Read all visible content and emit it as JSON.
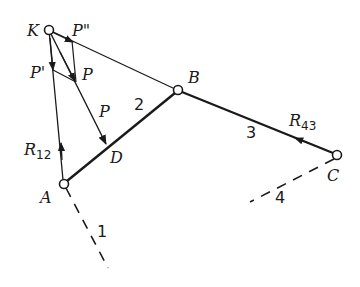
{
  "diagram": {
    "type": "mechanism force diagram",
    "points": {
      "K": {
        "label": "K",
        "x": 49,
        "y": 30
      },
      "B": {
        "label": "B",
        "x": 178,
        "y": 90
      },
      "A": {
        "label": "A",
        "x": 64,
        "y": 184
      },
      "C": {
        "label": "C",
        "x": 337,
        "y": 155
      },
      "D": {
        "label": "D",
        "x": 107,
        "y": 146
      }
    },
    "forces": {
      "P_top": "P",
      "P_lower": "P",
      "P_prime": "P'",
      "P_double_prime": "P\"",
      "R12_main": "R",
      "R12_sub": "12",
      "R43_main": "R",
      "R43_sub": "43"
    },
    "links": {
      "link1": "1",
      "link2": "2",
      "link3": "3",
      "link4": "4"
    },
    "colors": {
      "stroke": "#1a1a1a",
      "background": "#ffffff"
    }
  }
}
